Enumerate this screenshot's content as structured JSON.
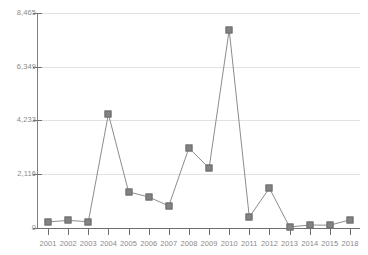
{
  "chart_data": {
    "type": "line",
    "title": "",
    "subtitle": "",
    "xlabel": "",
    "ylabel": "",
    "grid": true,
    "legend": "none",
    "marker": "square",
    "series_color": "#828282",
    "line_color": "#8c8c8c",
    "grid_color": "#e2e2e2",
    "axis_color": "#6f6f6f",
    "label_color": "#8a8a8a",
    "ylim": [
      0,
      8465
    ],
    "ytick_values": [
      0,
      2116,
      4233,
      6349,
      8465
    ],
    "ytick_labels": [
      "0",
      "2,116",
      "4,233",
      "6,349",
      "8,465"
    ],
    "categories": [
      "2001",
      "2002",
      "2003",
      "2004",
      "2005",
      "2006",
      "2007",
      "2008",
      "2009",
      "2010",
      "2011",
      "2012",
      "2013",
      "2014",
      "2015",
      "2018"
    ],
    "values": [
      240,
      300,
      250,
      4490,
      1420,
      1220,
      870,
      3150,
      2360,
      7800,
      430,
      1570,
      40,
      120,
      110,
      320
    ]
  }
}
